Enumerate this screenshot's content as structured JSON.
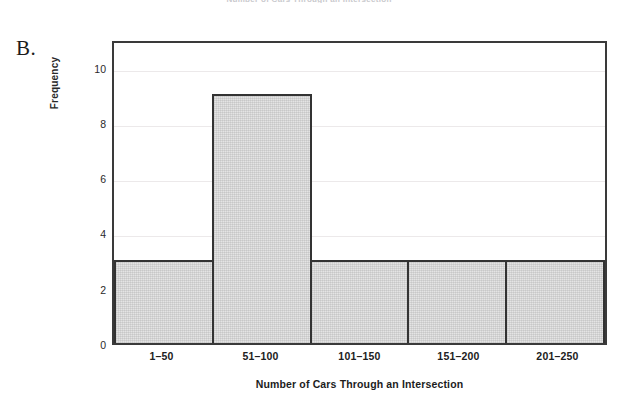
{
  "figure": {
    "panel_label": "B.",
    "cropped_caption": "Number of Cars Through an Intersection"
  },
  "chart_data": {
    "type": "bar",
    "title": "",
    "subtitle": "",
    "categories": [
      "1–50",
      "51–100",
      "101–150",
      "151–200",
      "201–250"
    ],
    "values": [
      3,
      9,
      3,
      3,
      3
    ],
    "series": [
      {
        "name": "Frequency",
        "values": [
          3,
          9,
          3,
          3,
          3
        ]
      }
    ],
    "xlabel": "Number of Cars Through an Intersection",
    "ylabel": "Frequency",
    "ylim": [
      0,
      11
    ],
    "yticks": [
      0,
      2,
      4,
      6,
      8,
      10
    ],
    "ytick_labels": [
      "0",
      "2",
      "4",
      "6",
      "8",
      "10"
    ],
    "grid": "horizontal",
    "legend": "none",
    "bar_gap": 0,
    "colors": {
      "bar_fill": "#e4e4e4",
      "bar_edge": "#333333",
      "frame": "#3a3a3a",
      "gridline": "#ece9ea",
      "text": "#1c1c1c"
    },
    "annotations": []
  }
}
